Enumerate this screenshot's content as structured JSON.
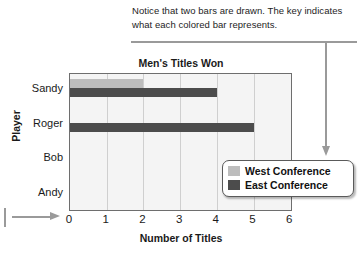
{
  "annotation": {
    "text": "Notice that two bars are drawn. The key indicates what each colored bar represents."
  },
  "chart_data": {
    "type": "bar",
    "orientation": "horizontal",
    "title": "Men's Titles Won",
    "xlabel": "Number of Titles",
    "ylabel": "Player",
    "categories": [
      "Sandy",
      "Roger",
      "Bob",
      "Andy"
    ],
    "series": [
      {
        "name": "West Conference",
        "color": "#bdbdbd",
        "values": [
          2,
          0,
          0,
          0
        ]
      },
      {
        "name": "East Conference",
        "color": "#4c4c4c",
        "values": [
          4,
          5,
          0,
          0
        ]
      }
    ],
    "xlim": [
      0,
      6
    ],
    "xticks": [
      "0",
      "1",
      "2",
      "3",
      "4",
      "5",
      "6"
    ],
    "grid": true,
    "legend_position": "inside-bottom-right"
  },
  "legend": {
    "items": [
      {
        "label": "West Conference",
        "color": "#bdbdbd"
      },
      {
        "label": "East Conference",
        "color": "#4c4c4c"
      }
    ]
  }
}
